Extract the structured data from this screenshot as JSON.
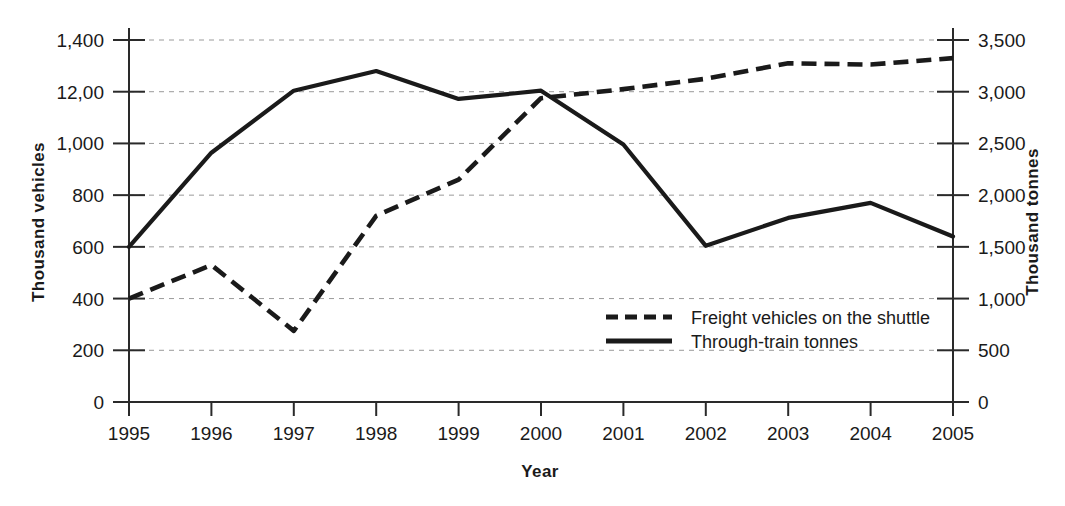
{
  "chart_data": {
    "type": "line",
    "title": "",
    "xlabel": "Year",
    "ylabel": "Thousand vehicles",
    "y2label": "Thousand tonnes",
    "grid": true,
    "legend_position": "inside-center-right",
    "x": [
      1995,
      1996,
      1997,
      1998,
      1999,
      2000,
      2001,
      2002,
      2003,
      2004,
      2005
    ],
    "categories": [
      "1995",
      "1996",
      "1997",
      "1998",
      "1999",
      "2000",
      "2001",
      "2002",
      "2003",
      "2004",
      "2005"
    ],
    "xtick_labels": [
      "1995",
      "1996",
      "1997",
      "1998",
      "1999",
      "2000",
      "2001",
      "2002",
      "2003",
      "2004",
      "2005"
    ],
    "ylim": [
      0,
      1400
    ],
    "ytick_values": [
      0,
      200,
      400,
      600,
      800,
      1000,
      1200,
      1400
    ],
    "ytick_labels": [
      "0",
      "200",
      "400",
      "600",
      "800",
      "1,000",
      "12,00",
      "1,400"
    ],
    "y2lim": [
      0,
      3500
    ],
    "y2tick_values": [
      0,
      500,
      1000,
      1500,
      2000,
      2500,
      3000,
      3500
    ],
    "y2tick_labels": [
      "0",
      "500",
      "1,000",
      "1,500",
      "2,000",
      "2,500",
      "3,000",
      "3,500"
    ],
    "series": [
      {
        "name": "Freight vehicles on the shuttle",
        "axis": "left",
        "style": "dashed",
        "units": "thousand vehicles",
        "values": [
          400,
          530,
          275,
          720,
          860,
          1175,
          1210,
          1250,
          1310,
          1305,
          1330
        ]
      },
      {
        "name": "Through-train tonnes",
        "axis": "right",
        "style": "solid",
        "units": "thousand tonnes",
        "values": [
          1500,
          2410,
          3010,
          3200,
          2930,
          3010,
          2490,
          1510,
          1780,
          1925,
          1600
        ]
      }
    ]
  },
  "legend": {
    "items": [
      {
        "label": "Freight vehicles on the shuttle",
        "style": "dashed"
      },
      {
        "label": "Through-train tonnes",
        "style": "solid"
      }
    ]
  },
  "colors": {
    "ink": "#1a1a1a",
    "grid": "#9a9a9a",
    "background": "#ffffff"
  }
}
